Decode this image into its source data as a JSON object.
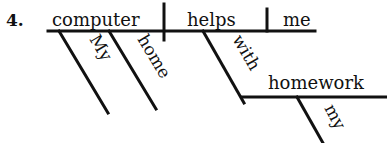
{
  "diagram": {
    "type": "reed-kellogg-sentence-diagram",
    "number": "4.",
    "sentence_words": {
      "subject": "computer",
      "verb": "helps",
      "direct_object": "me",
      "subject_modifier_1": "My",
      "subject_modifier_2": "home",
      "preposition": "with",
      "prepositional_object": "homework",
      "object_modifier": "my"
    },
    "line_color": "#111111"
  }
}
